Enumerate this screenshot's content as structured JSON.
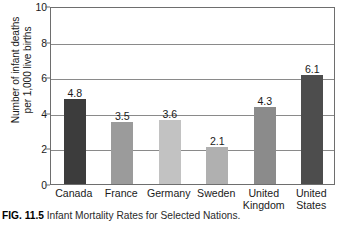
{
  "chart_data": {
    "type": "bar",
    "title": "Infant Mortality Rates for Selected Nations",
    "xlabel": "",
    "ylabel": "Number of infant deaths per 1,000 live births",
    "ylabel_line1": "Number of infant deaths",
    "ylabel_line2": "per 1,000 live births",
    "ylim": [
      0,
      10
    ],
    "yticks": [
      "0",
      "2",
      "4",
      "6",
      "8",
      "10"
    ],
    "ytick_values": [
      0,
      2,
      4,
      6,
      8,
      10
    ],
    "grid": "horizontal",
    "legend": "none",
    "categories": [
      "Canada",
      "France",
      "Germany",
      "Sweden",
      "United Kingdom",
      "United States"
    ],
    "category_lines": [
      [
        "Canada"
      ],
      [
        "France"
      ],
      [
        "Germany"
      ],
      [
        "Sweden"
      ],
      [
        "United",
        "Kingdom"
      ],
      [
        "United",
        "States"
      ]
    ],
    "values": [
      4.8,
      3.5,
      3.6,
      2.1,
      4.3,
      6.1
    ],
    "value_labels": [
      "4.8",
      "3.5",
      "3.6",
      "2.1",
      "4.3",
      "6.1"
    ],
    "bar_colors": [
      "#3c3c3c",
      "#9b9b9b",
      "#c2c2c2",
      "#b0b0b0",
      "#8b8b8b",
      "#4d4d4d"
    ]
  },
  "caption": {
    "label": "FIG. 11.5",
    "text": " Infant Mortality Rates for Selected Nations."
  },
  "colors": {
    "axis": "#6e6e6e",
    "gridline": "#8a8a8a",
    "text": "#1a1a1a",
    "background": "#ffffff"
  }
}
